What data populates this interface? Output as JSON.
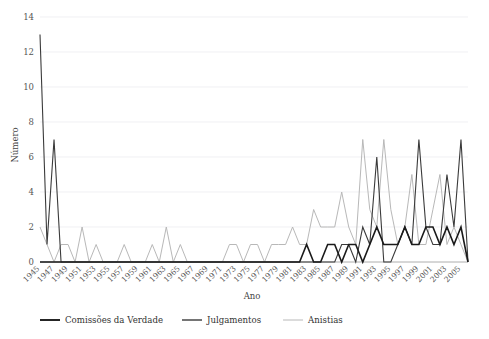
{
  "chart_data": {
    "type": "line",
    "title": "",
    "xlabel": "Ano",
    "ylabel": "Número",
    "xlim": [
      1945,
      2006
    ],
    "ylim": [
      0,
      14
    ],
    "yticks": [
      0,
      2,
      4,
      6,
      8,
      10,
      12,
      14
    ],
    "grid": true,
    "legend_position": "bottom",
    "x": [
      1945,
      1946,
      1947,
      1948,
      1949,
      1950,
      1951,
      1952,
      1953,
      1954,
      1955,
      1956,
      1957,
      1958,
      1959,
      1960,
      1961,
      1962,
      1963,
      1964,
      1965,
      1966,
      1967,
      1968,
      1969,
      1970,
      1971,
      1972,
      1973,
      1974,
      1975,
      1976,
      1977,
      1978,
      1979,
      1980,
      1981,
      1982,
      1983,
      1984,
      1985,
      1986,
      1987,
      1988,
      1989,
      1990,
      1991,
      1992,
      1993,
      1994,
      1995,
      1996,
      1997,
      1998,
      1999,
      2000,
      2001,
      2002,
      2003,
      2004,
      2005,
      2006
    ],
    "xtick_labels": [
      "1945",
      "1947",
      "1949",
      "1951",
      "1953",
      "1955",
      "1957",
      "1959",
      "1961",
      "1963",
      "1965",
      "1967",
      "1969",
      "1971",
      "1973",
      "1975",
      "1977",
      "1979",
      "1981",
      "1983",
      "1985",
      "1987",
      "1989",
      "1991",
      "1993",
      "1995",
      "1997",
      "1999",
      "2001",
      "2003",
      "2005"
    ],
    "series": [
      {
        "name": "Comissões da Verdade",
        "color": "#1a1a1a",
        "width": 1.6,
        "values": [
          0,
          0,
          0,
          0,
          0,
          0,
          0,
          0,
          0,
          0,
          0,
          0,
          0,
          0,
          0,
          0,
          0,
          0,
          0,
          0,
          0,
          0,
          0,
          0,
          0,
          0,
          0,
          0,
          0,
          0,
          0,
          0,
          0,
          0,
          0,
          0,
          0,
          0,
          1,
          0,
          0,
          1,
          1,
          0,
          1,
          1,
          0,
          1,
          2,
          1,
          1,
          1,
          2,
          1,
          1,
          2,
          2,
          1,
          2,
          1,
          2,
          0
        ]
      },
      {
        "name": "Julgamentos",
        "color": "#3a3a3a",
        "width": 1.1,
        "values": [
          13,
          1,
          7,
          0,
          0,
          0,
          0,
          0,
          0,
          0,
          0,
          0,
          0,
          0,
          0,
          0,
          0,
          0,
          0,
          0,
          0,
          0,
          0,
          0,
          0,
          0,
          0,
          0,
          0,
          0,
          0,
          0,
          0,
          0,
          0,
          0,
          0,
          0,
          0,
          0,
          0,
          0,
          0,
          1,
          1,
          0,
          2,
          1,
          6,
          0,
          0,
          1,
          2,
          1,
          7,
          2,
          1,
          1,
          5,
          2,
          7,
          0
        ]
      },
      {
        "name": "Anistias",
        "color": "#b8b8b8",
        "width": 1.0,
        "values": [
          2,
          1,
          0,
          1,
          1,
          0,
          2,
          0,
          1,
          0,
          0,
          0,
          1,
          0,
          0,
          0,
          1,
          0,
          2,
          0,
          1,
          0,
          0,
          0,
          0,
          0,
          0,
          1,
          1,
          0,
          1,
          1,
          0,
          1,
          1,
          1,
          2,
          1,
          1,
          3,
          2,
          2,
          2,
          4,
          2,
          1,
          7,
          3,
          2,
          7,
          3,
          1,
          2,
          5,
          1,
          1,
          3,
          5,
          1,
          2,
          1,
          0
        ]
      }
    ]
  },
  "axis": {
    "y_label": "Número",
    "x_label": "Ano"
  },
  "legend": {
    "items": [
      {
        "label": "Comissões da Verdade",
        "color": "#1a1a1a",
        "width": 1.9
      },
      {
        "label": "Julgamentos",
        "color": "#3a3a3a",
        "width": 1.4
      },
      {
        "label": "Anistias",
        "color": "#b8b8b8",
        "width": 1.0
      }
    ]
  }
}
